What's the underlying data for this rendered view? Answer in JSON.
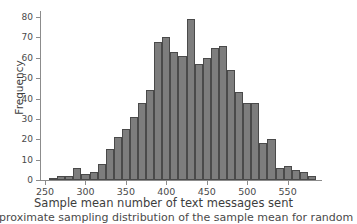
{
  "figure": {
    "caption_partial": "pproximate sampling distribution of the sample mean for random"
  },
  "chart_data": {
    "type": "bar",
    "title": "",
    "subtitle": "",
    "xlabel": "Sample mean number of text messages sent",
    "ylabel": "Frequency",
    "xlim": [
      245,
      590
    ],
    "ylim": [
      0,
      82
    ],
    "grid": false,
    "legend": null,
    "bin_width": 10,
    "x_ticks": [
      250,
      300,
      350,
      400,
      450,
      500,
      550
    ],
    "y_ticks": [
      0,
      10,
      20,
      30,
      40,
      50,
      60,
      70,
      80
    ],
    "bar_color": "#7d7d7d",
    "bar_edge_color": "#4a4a4a",
    "axis_color": "#8c8c8c",
    "bin_starts": [
      255,
      265,
      275,
      285,
      295,
      305,
      315,
      325,
      335,
      345,
      355,
      365,
      375,
      385,
      395,
      405,
      415,
      425,
      435,
      445,
      455,
      465,
      475,
      485,
      495,
      505,
      515,
      525,
      535,
      545,
      555,
      565,
      575
    ],
    "categories": [
      "255-265",
      "265-275",
      "275-285",
      "285-295",
      "295-305",
      "305-315",
      "315-325",
      "325-335",
      "335-345",
      "345-355",
      "355-365",
      "365-375",
      "375-385",
      "385-395",
      "395-405",
      "405-415",
      "415-425",
      "425-435",
      "435-445",
      "445-455",
      "455-465",
      "465-475",
      "475-485",
      "485-495",
      "495-505",
      "505-515",
      "515-525",
      "525-535",
      "535-545",
      "545-555",
      "555-565",
      "565-575",
      "575-585"
    ],
    "values": [
      1,
      2,
      2,
      6,
      3,
      4,
      8,
      15,
      21,
      25,
      31,
      38,
      44,
      68,
      70,
      63,
      61,
      79,
      57,
      60,
      65,
      66,
      54,
      43,
      38,
      38,
      18,
      20,
      6,
      7,
      5,
      4,
      2
    ]
  }
}
